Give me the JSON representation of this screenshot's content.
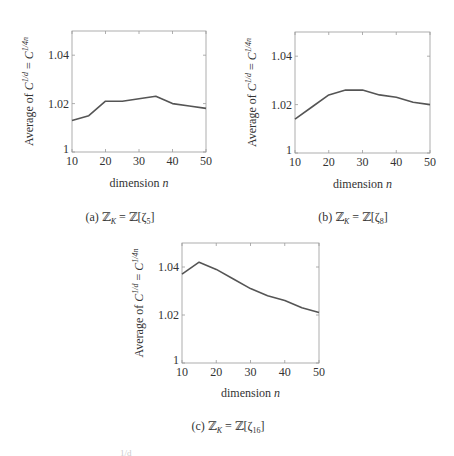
{
  "chart_data": [
    {
      "type": "line",
      "id": "a",
      "title": "",
      "caption": "(a) ℤ_K = ℤ[ζ₅]",
      "xlabel": "dimension n",
      "ylabel": "Average of C^{1/d} = C^{1/4n}",
      "x": [
        10,
        15,
        20,
        25,
        30,
        35,
        40,
        45,
        50
      ],
      "values": [
        1.013,
        1.015,
        1.021,
        1.021,
        1.022,
        1.023,
        1.02,
        1.019,
        1.018
      ],
      "xlim": [
        10,
        50
      ],
      "ylim": [
        1.0,
        1.05
      ],
      "xticks": [
        10,
        20,
        30,
        40,
        50
      ],
      "yticks": [
        1,
        1.02,
        1.04
      ],
      "ytick_labels": [
        "1",
        "1.02",
        "1.04"
      ],
      "grid": false,
      "legend": null
    },
    {
      "type": "line",
      "id": "b",
      "title": "",
      "caption": "(b) ℤ_K = ℤ[ζ₈]",
      "xlabel": "dimension n",
      "ylabel": "Average of C^{1/d} = C^{1/4n}",
      "x": [
        10,
        15,
        20,
        25,
        30,
        35,
        40,
        45,
        50
      ],
      "values": [
        1.014,
        1.019,
        1.024,
        1.026,
        1.026,
        1.024,
        1.023,
        1.021,
        1.02
      ],
      "xlim": [
        10,
        50
      ],
      "ylim": [
        1.0,
        1.05
      ],
      "xticks": [
        10,
        20,
        30,
        40,
        50
      ],
      "yticks": [
        1,
        1.02,
        1.04
      ],
      "ytick_labels": [
        "1",
        "1.02",
        "1.04"
      ],
      "grid": false,
      "legend": null
    },
    {
      "type": "line",
      "id": "c",
      "title": "",
      "caption": "(c) ℤ_K = ℤ[ζ₁₆]",
      "xlabel": "dimension n",
      "ylabel": "Average of C^{1/d} = C^{1/4n}",
      "x": [
        10,
        15,
        20,
        25,
        30,
        35,
        40,
        45,
        50
      ],
      "values": [
        1.037,
        1.042,
        1.039,
        1.035,
        1.031,
        1.028,
        1.026,
        1.023,
        1.021
      ],
      "xlim": [
        10,
        50
      ],
      "ylim": [
        1.0,
        1.05
      ],
      "xticks": [
        10,
        20,
        30,
        40,
        50
      ],
      "yticks": [
        1,
        1.02,
        1.04
      ],
      "ytick_labels": [
        "1",
        "1.02",
        "1.04"
      ],
      "grid": false,
      "legend": null
    }
  ],
  "captions": {
    "a": {
      "prefix": "(a) ",
      "lhs": "ℤ",
      "lhs_sub": "K",
      "eq": " = ℤ[ζ",
      "sub": "5",
      "close": "]"
    },
    "b": {
      "prefix": "(b) ",
      "lhs": "ℤ",
      "lhs_sub": "K",
      "eq": " = ℤ[ζ",
      "sub": "8",
      "close": "]"
    },
    "c": {
      "prefix": "(c) ",
      "lhs": "ℤ",
      "lhs_sub": "K",
      "eq": " = ℤ[ζ",
      "sub": "16",
      "close": "]"
    }
  },
  "axis_text": {
    "xlabel_word": "dimension ",
    "xlabel_var": "n",
    "ylabel_prefix": "Average of ",
    "ylabel_C1": "C",
    "ylabel_exp1": "1/d",
    "ylabel_eq": " = ",
    "ylabel_C2": "C",
    "ylabel_exp2": "1/4n"
  },
  "style": {
    "line_color": "#555555",
    "frame_color": "#9a9a9a",
    "text_color": "#333333"
  },
  "cut_text": "1/d"
}
